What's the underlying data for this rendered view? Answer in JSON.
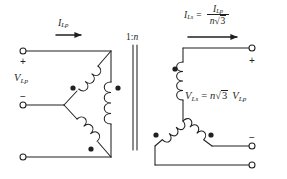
{
  "diagram": {
    "colors": {
      "line": "#231f20",
      "background": "#ffffff",
      "dot": "#231f20"
    },
    "primary": {
      "config": "delta",
      "voltage_label": "V",
      "voltage_sub": "Lp",
      "current_label": "I",
      "current_sub": "Lp",
      "terminal_plus": "+",
      "terminal_minus": "−"
    },
    "core": {
      "ratio_label": "1:",
      "ratio_n": "n"
    },
    "secondary": {
      "config": "wye",
      "current_label": "I",
      "current_sub": "Ls",
      "equals": "=",
      "numerator_label": "I",
      "numerator_sub": "Lp",
      "denominator_n": "n",
      "denominator_radical": "√",
      "denominator_radicand": "3",
      "voltage_label": "V",
      "voltage_sub": "Ls",
      "voltage_equals": "=",
      "voltage_n": "n",
      "voltage_radical": "√",
      "voltage_radicand": "3",
      "voltage_of_label": "V",
      "voltage_of_sub": "Lp",
      "terminal_plus": "+",
      "terminal_minus": "−"
    },
    "icons": {
      "current_arrow_primary": "right-arrow-icon",
      "current_arrow_secondary": "right-arrow-icon",
      "polarity_dot": "polarity-dot-icon",
      "terminal": "terminal-circle-icon",
      "coil": "transformer-coil-icon",
      "core": "transformer-core-icon"
    }
  }
}
